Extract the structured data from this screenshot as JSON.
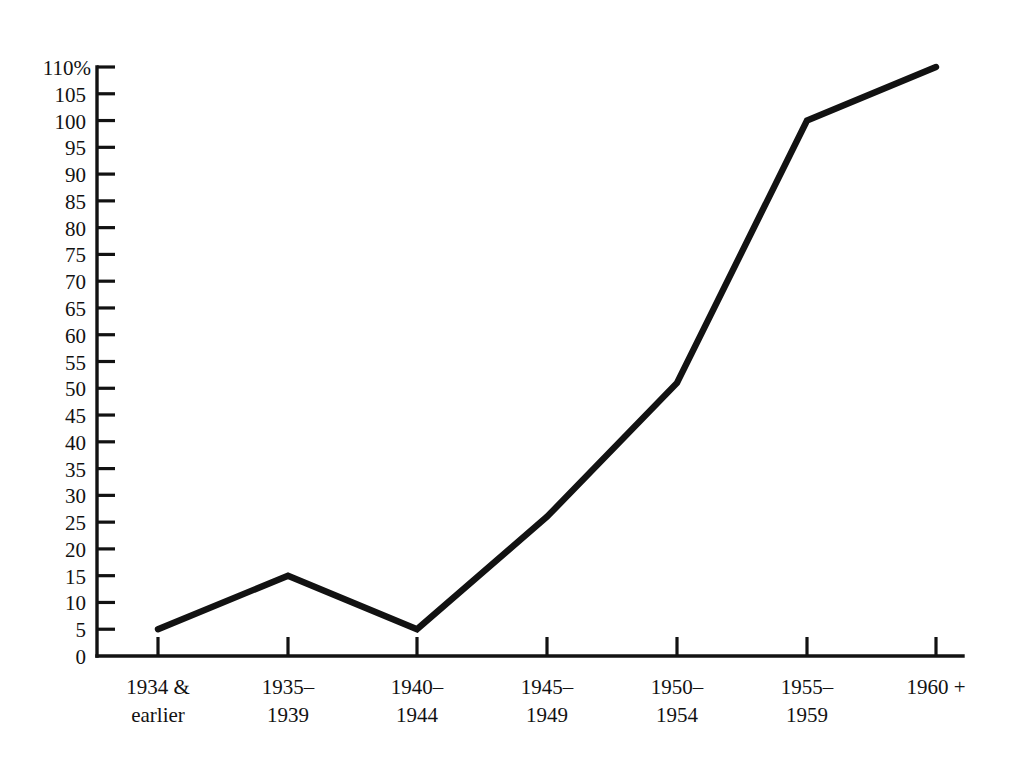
{
  "chart_data": {
    "type": "line",
    "title": "",
    "subtitle": "",
    "xlabel": "",
    "ylabel": "",
    "y_unit_label": "110%",
    "categories": [
      "1934 &\nearlier",
      "1935–\n1939",
      "1940–\n1944",
      "1945–\n1949",
      "1950–\n1954",
      "1955–\n1959",
      "1960 +"
    ],
    "categories_lines": [
      [
        "1934 &",
        "earlier"
      ],
      [
        "1935–",
        "1939"
      ],
      [
        "1940–",
        "1944"
      ],
      [
        "1945–",
        "1949"
      ],
      [
        "1950–",
        "1954"
      ],
      [
        "1955–",
        "1959"
      ],
      [
        "1960 +",
        ""
      ]
    ],
    "values": [
      5,
      15,
      5,
      26,
      51,
      100,
      110
    ],
    "series": [
      {
        "name": "",
        "values": [
          5,
          15,
          5,
          26,
          51,
          100,
          110
        ]
      }
    ],
    "ylim": [
      0,
      110
    ],
    "y_ticks": [
      0,
      5,
      10,
      15,
      20,
      25,
      30,
      35,
      40,
      45,
      50,
      55,
      60,
      65,
      70,
      75,
      80,
      85,
      90,
      95,
      100,
      105,
      110
    ],
    "y_tick_labels": [
      "0",
      "5",
      "10",
      "15",
      "20",
      "25",
      "30",
      "35",
      "40",
      "45",
      "50",
      "55",
      "60",
      "65",
      "70",
      "75",
      "80",
      "85",
      "90",
      "95",
      "100",
      "105",
      "110%"
    ],
    "grid": false,
    "legend": [],
    "legend_position": "none",
    "line_color": "#121212",
    "axis_color": "#121212",
    "background_color": "#ffffff"
  }
}
